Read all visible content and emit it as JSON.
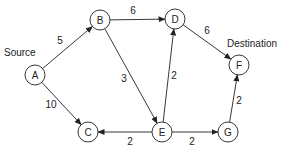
{
  "diagram": {
    "type": "directed-weighted-graph",
    "annotations": {
      "source_label": "Source",
      "destination_label": "Destination"
    },
    "nodes": [
      {
        "id": "A",
        "label": "A",
        "x": 35,
        "y": 75
      },
      {
        "id": "B",
        "label": "B",
        "x": 100,
        "y": 20
      },
      {
        "id": "C",
        "label": "C",
        "x": 88,
        "y": 132
      },
      {
        "id": "D",
        "label": "D",
        "x": 175,
        "y": 19
      },
      {
        "id": "E",
        "label": "E",
        "x": 162,
        "y": 132
      },
      {
        "id": "F",
        "label": "F",
        "x": 239,
        "y": 65
      },
      {
        "id": "G",
        "label": "G",
        "x": 228,
        "y": 132
      }
    ],
    "edges": [
      {
        "from": "A",
        "to": "B",
        "weight": "5",
        "lx": 60,
        "ly": 44
      },
      {
        "from": "A",
        "to": "C",
        "weight": "10",
        "lx": 51,
        "ly": 108
      },
      {
        "from": "B",
        "to": "D",
        "weight": "6",
        "lx": 133,
        "ly": 14
      },
      {
        "from": "B",
        "to": "E",
        "weight": "3",
        "lx": 124,
        "ly": 82
      },
      {
        "from": "D",
        "to": "F",
        "weight": "6",
        "lx": 207,
        "ly": 34
      },
      {
        "from": "E",
        "to": "D",
        "weight": "2",
        "lx": 174,
        "ly": 79
      },
      {
        "from": "E",
        "to": "C",
        "weight": "2",
        "lx": 130,
        "ly": 145
      },
      {
        "from": "E",
        "to": "G",
        "weight": "2",
        "lx": 192,
        "ly": 145
      },
      {
        "from": "G",
        "to": "F",
        "weight": "2",
        "lx": 239,
        "ly": 104
      }
    ]
  }
}
